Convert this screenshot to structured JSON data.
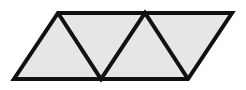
{
  "figure": {
    "name": "parallelogram-divided-into-four-triangles",
    "canvas": {
      "width": 246,
      "height": 90,
      "background": "#ffffff"
    },
    "style": {
      "fill": "#e6e6e6",
      "stroke": "#111111",
      "outline_stroke_width": 4,
      "inner_stroke_width": 4,
      "line_join": "miter"
    },
    "vertices": {
      "top_left": [
        58,
        13
      ],
      "top_mid": [
        145,
        13
      ],
      "top_right": [
        232,
        13
      ],
      "bottom_left": [
        14,
        79
      ],
      "bottom_mid": [
        101,
        79
      ],
      "bottom_right": [
        188,
        79
      ]
    },
    "outline_path": "M58,13 L232,13 L188,79 L14,79 Z",
    "inner_lines": [
      {
        "name": "zigzag-left-down",
        "from": [
          58,
          13
        ],
        "to": [
          101,
          79
        ]
      },
      {
        "name": "zigzag-mid-up",
        "from": [
          101,
          79
        ],
        "to": [
          145,
          13
        ]
      },
      {
        "name": "zigzag-right-down",
        "from": [
          145,
          13
        ],
        "to": [
          188,
          79
        ]
      }
    ],
    "triangles": [
      {
        "name": "triangle-1",
        "points": "14,79 58,13 101,79",
        "orientation": "up"
      },
      {
        "name": "triangle-2",
        "points": "58,13 145,13 101,79",
        "orientation": "down"
      },
      {
        "name": "triangle-3",
        "points": "101,79 145,13 188,79",
        "orientation": "up"
      },
      {
        "name": "triangle-4",
        "points": "145,13 232,13 188,79",
        "orientation": "down"
      }
    ],
    "triangle_count": 4
  }
}
